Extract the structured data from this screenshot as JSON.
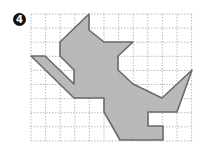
{
  "problem": {
    "number": "4"
  },
  "figure": {
    "type": "grid-polygon",
    "grid": {
      "columns": 11,
      "rows": 9,
      "line_style": "dashed",
      "line_color": "#aaaaaa"
    },
    "shape": {
      "description": "cat-like silhouette on dotted grid",
      "fill": "#b3b3b3",
      "stroke": "#6a6a6a",
      "points": "89,14 89,30 104,42 133,42 118,56 118,70 133,84 162,98 192,70 177,112 148,112 148,126 163,126 163,140 120,140 104,112 104,98 74,98 31,56 45,56 74,84 74,70 60,56 60,42"
    },
    "colors": {
      "fill": "#b3b3b3",
      "stroke": "#6a6a6a",
      "grid": "#aaaaaa",
      "badge": "#111111"
    }
  }
}
